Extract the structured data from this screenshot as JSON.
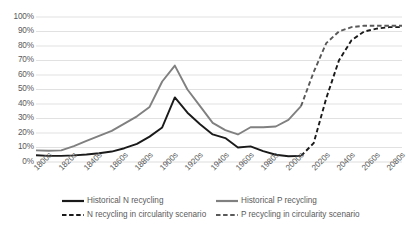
{
  "chart_data": {
    "type": "line",
    "title": "",
    "xlabel": "",
    "ylabel": "",
    "ylim": [
      0,
      100
    ],
    "y_unit": "%",
    "grid": true,
    "legend_position": "bottom",
    "categories": [
      "1800s",
      "1810s",
      "1820s",
      "1830s",
      "1840s",
      "1850s",
      "1860s",
      "1870s",
      "1880s",
      "1890s",
      "1900s",
      "1910s",
      "1920s",
      "1930s",
      "1940s",
      "1950s",
      "1960s",
      "1970s",
      "1980s",
      "1990s",
      "2000s",
      "2010s",
      "2020s",
      "2030s",
      "2040s",
      "2050s",
      "2060s",
      "2070s",
      "2080s",
      "2090s"
    ],
    "tick_labels": [
      "1800s",
      "1820s",
      "1840s",
      "1860s",
      "1880s",
      "1900s",
      "1920s",
      "1940s",
      "1960s",
      "1980s",
      "2000s",
      "2020s",
      "2040s",
      "2060s",
      "2080s"
    ],
    "y_tick_labels": [
      "100%",
      "90%",
      "80%",
      "70%",
      "60%",
      "50%",
      "40%",
      "30%",
      "20%",
      "10%",
      "0%"
    ],
    "y_ticks": [
      100,
      90,
      80,
      70,
      60,
      50,
      40,
      30,
      20,
      10,
      0
    ],
    "series": [
      {
        "name": "Historical N recycling",
        "style": "solid",
        "color": "#1a1a1a",
        "x": [
          "1800s",
          "1810s",
          "1820s",
          "1830s",
          "1840s",
          "1850s",
          "1860s",
          "1870s",
          "1880s",
          "1890s",
          "1900s",
          "1910s",
          "1920s",
          "1930s",
          "1940s",
          "1950s",
          "1960s",
          "1970s",
          "1980s",
          "1990s",
          "2000s",
          "2010s"
        ],
        "values": [
          4.7,
          4.2,
          4.2,
          4.6,
          5.2,
          6.0,
          7.2,
          9.5,
          12.5,
          17.5,
          23.8,
          44.5,
          34.0,
          26.0,
          19.0,
          16.5,
          10.0,
          10.8,
          7.5,
          5.0,
          4.0,
          4.2
        ]
      },
      {
        "name": "Historical P recycling",
        "style": "solid",
        "color": "#808080",
        "x": [
          "1800s",
          "1810s",
          "1820s",
          "1830s",
          "1840s",
          "1850s",
          "1860s",
          "1870s",
          "1880s",
          "1890s",
          "1900s",
          "1910s",
          "1920s",
          "1930s",
          "1940s",
          "1950s",
          "1960s",
          "1970s",
          "1980s",
          "1990s",
          "2000s",
          "2010s"
        ],
        "values": [
          8.0,
          7.8,
          8.0,
          11.0,
          14.5,
          18.0,
          21.5,
          26.5,
          31.5,
          38.0,
          55.5,
          66.5,
          50.0,
          38.5,
          27.0,
          22.0,
          19.0,
          24.0,
          24.0,
          24.5,
          29.0,
          38.5
        ]
      },
      {
        "name": "N recycling in circularity scenario",
        "style": "dashed",
        "color": "#1a1a1a",
        "x": [
          "2010s",
          "2020s",
          "2030s",
          "2040s",
          "2050s",
          "2060s",
          "2070s",
          "2080s",
          "2090s"
        ],
        "values": [
          4.2,
          13.0,
          44.0,
          70.0,
          84.0,
          90.0,
          92.0,
          93.0,
          93.0
        ]
      },
      {
        "name": "P recycling in circularity scenario",
        "style": "dashed",
        "color": "#595959",
        "x": [
          "2010s",
          "2020s",
          "2030s",
          "2040s",
          "2050s",
          "2060s",
          "2070s",
          "2080s",
          "2090s"
        ],
        "values": [
          38.5,
          62.0,
          82.0,
          90.0,
          93.0,
          94.0,
          94.0,
          94.0,
          94.0
        ]
      }
    ]
  },
  "legend": {
    "items": [
      {
        "label": "Historical N recycling",
        "style": "solid",
        "color": "#1a1a1a",
        "icon": "solid-line-icon"
      },
      {
        "label": "Historical P recycling",
        "style": "solid",
        "color": "#808080",
        "icon": "solid-line-icon"
      },
      {
        "label": "N recycling in circularity scenario",
        "style": "dashed",
        "color": "#1a1a1a",
        "icon": "dashed-line-icon"
      },
      {
        "label": "P recycling in circularity scenario",
        "style": "dashed",
        "color": "#595959",
        "icon": "dashed-line-icon"
      }
    ]
  },
  "colors": {
    "grid": "#d9d9d9",
    "text": "#5a5a5a",
    "background": "#ffffff",
    "n_historical": "#1a1a1a",
    "p_historical": "#808080",
    "n_scenario": "#1a1a1a",
    "p_scenario": "#595959"
  }
}
